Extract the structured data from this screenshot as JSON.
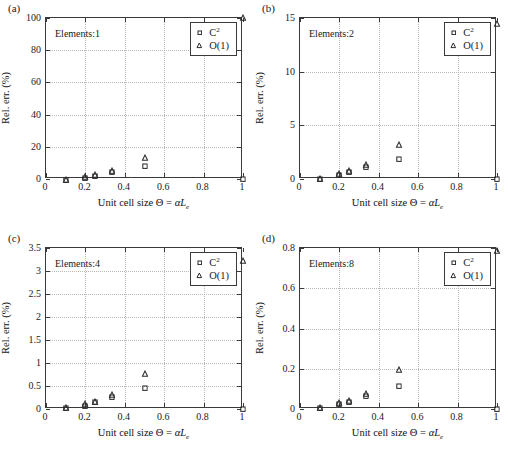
{
  "figure": {
    "panels": [
      {
        "id": "a",
        "panel_label": "(a)",
        "annotation": "Elements:1",
        "chart_data": {
          "type": "scatter",
          "title": "",
          "xlabel_parts": {
            "prefix": "Unit cell size ",
            "theta": "Θ",
            "equals": " = ",
            "alpha": "α",
            "L": "L",
            "sub": "e"
          },
          "ylabel": "Rel. err. (%)",
          "xlim": [
            0,
            1
          ],
          "ylim": [
            0,
            100
          ],
          "xticks": [
            0,
            0.2,
            0.4,
            0.6,
            0.8,
            1
          ],
          "xticklabels": [
            "0",
            "0.2",
            "0.4",
            "0.6",
            "0.8",
            "1"
          ],
          "yticks": [
            0,
            20,
            40,
            60,
            80,
            100
          ],
          "yticklabels": [
            "0",
            "20",
            "40",
            "60",
            "80",
            "100"
          ],
          "grid": true,
          "legend_position": "upper-right",
          "x": [
            0.1,
            0.2,
            0.25,
            0.333,
            0.5,
            1.0
          ],
          "series": [
            {
              "name": "C²",
              "marker": "square",
              "values": [
                0.6,
                1.9,
                3.0,
                5.4,
                9.0,
                1.2
              ]
            },
            {
              "name": "O(1)",
              "marker": "triangle",
              "values": [
                0.8,
                2.3,
                3.4,
                5.9,
                14.4,
                101.0
              ]
            }
          ]
        }
      },
      {
        "id": "b",
        "panel_label": "(b)",
        "annotation": "Elements:2",
        "chart_data": {
          "type": "scatter",
          "title": "",
          "xlabel_parts": {
            "prefix": "Unit cell size ",
            "theta": "Θ",
            "equals": " = ",
            "alpha": "α",
            "L": "L",
            "sub": "e"
          },
          "ylabel": "Rel. err. (%)",
          "xlim": [
            0,
            1
          ],
          "ylim": [
            0,
            15
          ],
          "xticks": [
            0,
            0.2,
            0.4,
            0.6,
            0.8,
            1
          ],
          "xticklabels": [
            "0",
            "0.2",
            "0.4",
            "0.6",
            "0.8",
            "1"
          ],
          "yticks": [
            0,
            5,
            10,
            15
          ],
          "yticklabels": [
            "0",
            "5",
            "10",
            "15"
          ],
          "grid": true,
          "legend_position": "upper-right",
          "x": [
            0.1,
            0.2,
            0.25,
            0.333,
            0.5,
            1.0
          ],
          "series": [
            {
              "name": "C²",
              "marker": "square",
              "values": [
                0.15,
                0.5,
                0.8,
                1.25,
                2.05,
                0.15
              ]
            },
            {
              "name": "O(1)",
              "marker": "triangle",
              "values": [
                0.2,
                0.6,
                0.9,
                1.45,
                3.3,
                14.6
              ]
            }
          ]
        }
      },
      {
        "id": "c",
        "panel_label": "(c)",
        "annotation": "Elements:4",
        "chart_data": {
          "type": "scatter",
          "title": "",
          "xlabel_parts": {
            "prefix": "Unit cell size ",
            "theta": "Θ",
            "equals": " = ",
            "alpha": "α",
            "L": "L",
            "sub": "e"
          },
          "ylabel": "Rel. err. (%)",
          "xlim": [
            0,
            1
          ],
          "ylim": [
            0,
            3.5
          ],
          "xticks": [
            0,
            0.2,
            0.4,
            0.6,
            0.8,
            1
          ],
          "xticklabels": [
            "0",
            "0.2",
            "0.4",
            "0.6",
            "0.8",
            "1"
          ],
          "yticks": [
            0,
            0.5,
            1,
            1.5,
            2,
            2.5,
            3,
            3.5
          ],
          "yticklabels": [
            "0",
            "0.5",
            "1",
            "1.5",
            "2",
            "2.5",
            "3",
            "3.5"
          ],
          "grid": true,
          "legend_position": "upper-right",
          "x": [
            0.1,
            0.2,
            0.25,
            0.333,
            0.5,
            1.0
          ],
          "series": [
            {
              "name": "C²",
              "marker": "square",
              "values": [
                0.05,
                0.11,
                0.18,
                0.3,
                0.5,
                0.04
              ]
            },
            {
              "name": "O(1)",
              "marker": "triangle",
              "values": [
                0.06,
                0.14,
                0.2,
                0.34,
                0.81,
                3.25
              ]
            }
          ]
        }
      },
      {
        "id": "d",
        "panel_label": "(d)",
        "annotation": "Elements:8",
        "chart_data": {
          "type": "scatter",
          "title": "",
          "xlabel_parts": {
            "prefix": "Unit cell size ",
            "theta": "Θ",
            "equals": " = ",
            "alpha": "α",
            "L": "L",
            "sub": "e"
          },
          "ylabel": "Rel. err. (%)",
          "xlim": [
            0,
            1
          ],
          "ylim": [
            0,
            0.8
          ],
          "xticks": [
            0,
            0.2,
            0.4,
            0.6,
            0.8,
            1
          ],
          "xticklabels": [
            "0",
            "0.2",
            "0.4",
            "0.6",
            "0.8",
            "1"
          ],
          "yticks": [
            0,
            0.2,
            0.4,
            0.6,
            0.8
          ],
          "yticklabels": [
            "0",
            "0.2",
            "0.4",
            "0.6",
            "0.8"
          ],
          "grid": true,
          "legend_position": "upper-right",
          "x": [
            0.1,
            0.2,
            0.25,
            0.333,
            0.5,
            1.0
          ],
          "series": [
            {
              "name": "C²",
              "marker": "square",
              "values": [
                0.012,
                0.033,
                0.043,
                0.073,
                0.122,
                0.008
              ]
            },
            {
              "name": "O(1)",
              "marker": "triangle",
              "values": [
                0.014,
                0.037,
                0.05,
                0.085,
                0.205,
                0.795
              ]
            }
          ]
        }
      }
    ],
    "legend_labels": {
      "series1": "C",
      "series1_sup": "2",
      "series2": "O(1)"
    },
    "colors": {
      "axis": "#3a3a3a",
      "grid": "#b9b9b9",
      "marker": "#2b2b2b",
      "text": "#1a1a1a"
    }
  }
}
